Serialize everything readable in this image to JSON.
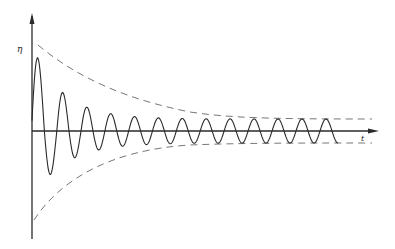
{
  "diagram": {
    "type": "damped-oscillation",
    "y_axis_label": "η",
    "x_axis_label": "t",
    "colors": {
      "ink": "#2a2a2a",
      "envelope": "#777777",
      "background": "#ffffff"
    }
  }
}
